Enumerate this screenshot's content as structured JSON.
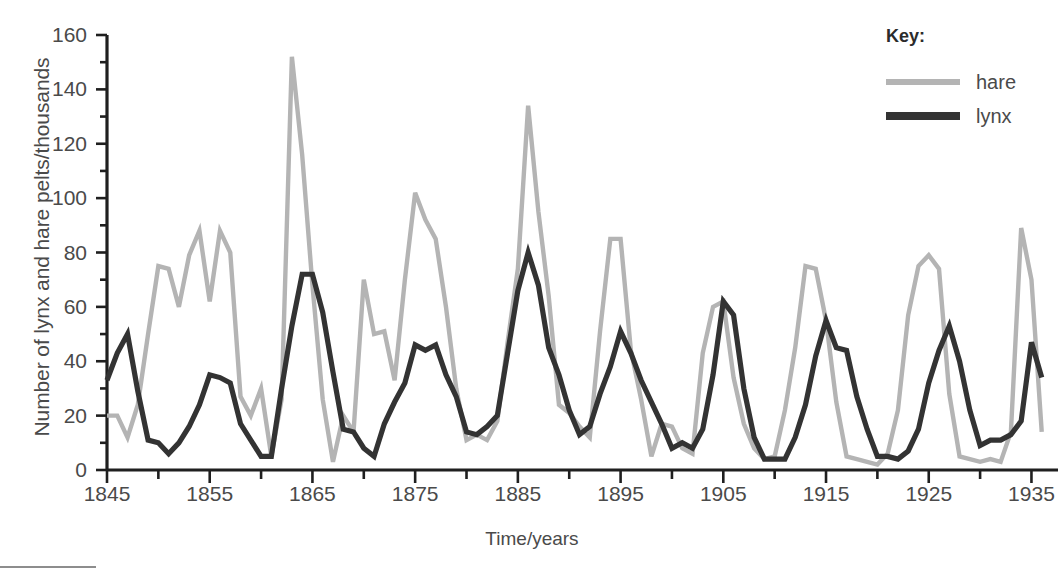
{
  "legend": {
    "title": "Key:",
    "entries": [
      {
        "label": "hare",
        "color": "#b4b4b4",
        "width": 6
      },
      {
        "label": "lynx",
        "color": "#333333",
        "width": 8
      }
    ]
  },
  "axes": {
    "y_label": "Number of lynx and hare pelts/thousands",
    "x_label": "Time/years",
    "y_ticks": [
      0,
      20,
      40,
      60,
      80,
      100,
      120,
      140,
      160
    ],
    "y_minor_step": 10,
    "x_ticks": [
      1845,
      1855,
      1865,
      1875,
      1885,
      1895,
      1905,
      1915,
      1925,
      1935
    ],
    "x_minor_step": 5
  },
  "chart_data": {
    "type": "line",
    "title": "",
    "xlabel": "Time/years",
    "ylabel": "Number of lynx and hare pelts/thousands",
    "xlim": [
      1845,
      1937
    ],
    "ylim": [
      0,
      160
    ],
    "grid": false,
    "legend_position": "right",
    "x": [
      1845,
      1846,
      1847,
      1848,
      1849,
      1850,
      1851,
      1852,
      1853,
      1854,
      1855,
      1856,
      1857,
      1858,
      1859,
      1860,
      1861,
      1862,
      1863,
      1864,
      1865,
      1866,
      1867,
      1868,
      1869,
      1870,
      1871,
      1872,
      1873,
      1874,
      1875,
      1876,
      1877,
      1878,
      1879,
      1880,
      1881,
      1882,
      1883,
      1884,
      1885,
      1886,
      1887,
      1888,
      1889,
      1890,
      1891,
      1892,
      1893,
      1894,
      1895,
      1896,
      1897,
      1898,
      1899,
      1900,
      1901,
      1902,
      1903,
      1904,
      1905,
      1906,
      1907,
      1908,
      1909,
      1910,
      1911,
      1912,
      1913,
      1914,
      1915,
      1916,
      1917,
      1918,
      1919,
      1920,
      1921,
      1922,
      1923,
      1924,
      1925,
      1926,
      1927,
      1928,
      1929,
      1930,
      1931,
      1932,
      1933,
      1934,
      1935,
      1936
    ],
    "series": [
      {
        "name": "hare",
        "color": "#b4b4b4",
        "values": [
          20,
          20,
          12,
          24,
          50,
          75,
          74,
          60,
          79,
          88,
          62,
          88,
          80,
          27,
          20,
          30,
          5,
          26,
          152,
          116,
          68,
          26,
          3,
          20,
          14,
          70,
          50,
          51,
          33,
          70,
          102,
          92,
          85,
          60,
          30,
          11,
          13,
          11,
          18,
          47,
          74,
          134,
          95,
          64,
          24,
          21,
          16,
          12,
          51,
          85,
          85,
          44,
          26,
          5,
          17,
          16,
          8,
          6,
          43,
          60,
          62,
          34,
          17,
          8,
          4,
          5,
          22,
          45,
          75,
          74,
          55,
          25,
          5,
          4,
          3,
          2,
          6,
          22,
          57,
          75,
          79,
          74,
          28,
          5,
          4,
          3,
          4,
          3,
          14,
          89,
          70,
          14
        ]
      },
      {
        "name": "lynx",
        "color": "#333333",
        "values": [
          33,
          43,
          50,
          29,
          11,
          10,
          6,
          10,
          16,
          24,
          35,
          34,
          32,
          17,
          11,
          5,
          5,
          30,
          53,
          72,
          72,
          58,
          36,
          15,
          14,
          8,
          5,
          17,
          25,
          32,
          46,
          44,
          46,
          35,
          27,
          14,
          13,
          16,
          20,
          43,
          66,
          80,
          68,
          45,
          35,
          22,
          13,
          16,
          28,
          38,
          51,
          43,
          33,
          25,
          17,
          8,
          10,
          8,
          15,
          35,
          62,
          57,
          30,
          12,
          4,
          4,
          4,
          12,
          24,
          42,
          55,
          45,
          44,
          27,
          15,
          5,
          5,
          4,
          7,
          15,
          32,
          44,
          53,
          40,
          22,
          9,
          11,
          11,
          13,
          18,
          47,
          34
        ]
      }
    ]
  }
}
